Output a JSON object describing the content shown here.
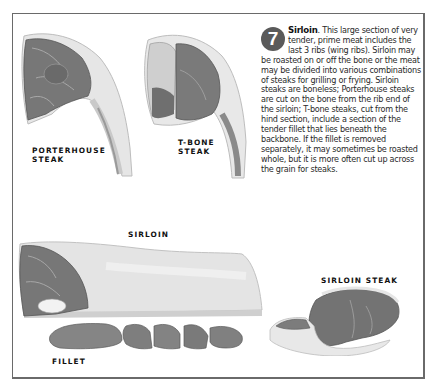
{
  "section": {
    "number": "7",
    "title": "Sirloin",
    "body": ". This large section of very tender, prime meat includes the last 3 ribs (wing ribs). Sirloin may be roasted on or off the bone or the meat may be divided into various combinations of steaks for grilling or frying. Sirloin steaks are boneless; Porterhouse steaks are cut on the bone from the rib end of the sirloin; T-bone steaks, cut from the hind section, include a section of the tender fillet that lies beneath the backbone. If the fillet is removed separately, it may sometimes be roasted whole, but it is more often cut up across the grain for steaks."
  },
  "illustrations": [
    {
      "id": "porterhouse",
      "label": "PORTERHOUSE\nSTEAK"
    },
    {
      "id": "tbone",
      "label": "T-BONE\nSTEAK"
    },
    {
      "id": "sirloin",
      "label": "SIRLOIN"
    },
    {
      "id": "sirloin-steak",
      "label": "SIRLOIN STEAK"
    },
    {
      "id": "fillet",
      "label": "FILLET"
    }
  ],
  "colors": {
    "badge": "#5a5a5a",
    "frame": "#6a6a6a",
    "meat_dark": "#6e6e6e",
    "meat_mid": "#8c8c8c",
    "fat": "#e2e2e2"
  }
}
